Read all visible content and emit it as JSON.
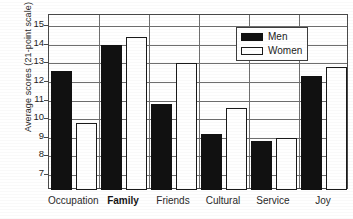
{
  "chart_data": {
    "type": "bar",
    "title": "",
    "subtitle": "",
    "xlabel": "",
    "ylabel": "Average scores (21-point scale)",
    "categories": [
      "Occupation",
      "Family",
      "Friends",
      "Cultural",
      "Service",
      "Joy"
    ],
    "series": [
      {
        "name": "Men",
        "color": "#111111",
        "values": [
          12.6,
          14.0,
          10.8,
          9.2,
          8.85,
          12.3
        ]
      },
      {
        "name": "Women",
        "color": "#ffffff",
        "values": [
          9.8,
          14.4,
          13.0,
          10.6,
          9.0,
          12.8
        ]
      }
    ],
    "ylim": [
      6.2,
      15.6
    ],
    "yticks": [
      7,
      8,
      9,
      10,
      11,
      12,
      13,
      14,
      15
    ],
    "ytick_labels": [
      "7",
      "8",
      "9",
      "10",
      "11",
      "12",
      "13",
      "14",
      "15"
    ],
    "grid": true,
    "grid_axis": "y",
    "legend": {
      "position": "top-right",
      "entries": [
        "Men",
        "Women"
      ]
    },
    "bar_gap": 0,
    "group_gap": 0
  }
}
